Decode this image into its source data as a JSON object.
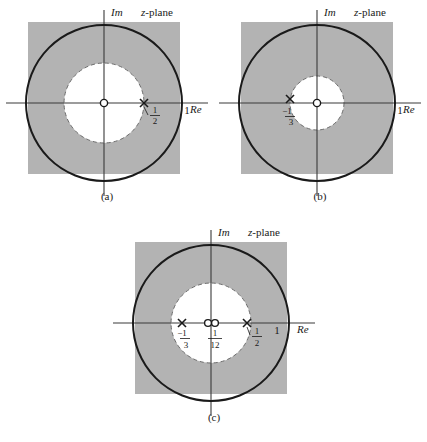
{
  "figure": {
    "type": "z-plane region-of-convergence diagrams",
    "panel_count": 3
  },
  "labels": {
    "imaginary_axis": "Im",
    "real_axis": "Re",
    "plane_title_italic": "z",
    "plane_title_rest": "-plane",
    "unit_tick": "1"
  },
  "colors": {
    "roc_shading": "#b3b3b3",
    "curve": "#1a1a1a",
    "axis": "#3a3a3a",
    "background": "#ffffff",
    "hole_fill": "#ffffff"
  },
  "panels": [
    {
      "id": "a",
      "caption": "(a)",
      "roc_inner_radius": 0.5,
      "roc_inner_boundary_style": "dashed",
      "unit_circle_radius": 1,
      "poles": [
        {
          "label_num": "1",
          "label_den": "2",
          "label_sign": "",
          "re": 0.5,
          "im": 0
        }
      ],
      "zeros": [
        {
          "re": 0,
          "im": 0
        }
      ],
      "tick_labels": [
        "1"
      ]
    },
    {
      "id": "b",
      "caption": "(b)",
      "roc_inner_radius": 0.3333,
      "roc_inner_boundary_style": "dashed",
      "unit_circle_radius": 1,
      "poles": [
        {
          "label_num": "1",
          "label_den": "3",
          "label_sign": "−",
          "re": -0.3333,
          "im": 0
        }
      ],
      "zeros": [
        {
          "re": 0,
          "im": 0
        }
      ],
      "tick_labels": [
        "1"
      ]
    },
    {
      "id": "c",
      "caption": "(c)",
      "roc_inner_radius": 0.5,
      "roc_inner_boundary_style": "dashed",
      "unit_circle_radius": 1,
      "poles": [
        {
          "label_num": "1",
          "label_den": "3",
          "label_sign": "−",
          "re": -0.3333,
          "im": 0
        },
        {
          "label_num": "1",
          "label_den": "2",
          "label_sign": "",
          "re": 0.5,
          "im": 0
        }
      ],
      "zeros": [
        {
          "re": 0,
          "im": 0
        },
        {
          "re": 0.0833,
          "im": 0,
          "label_num": "1",
          "label_den": "12",
          "label_sign": ""
        }
      ],
      "tick_labels": [
        "1"
      ]
    }
  ]
}
